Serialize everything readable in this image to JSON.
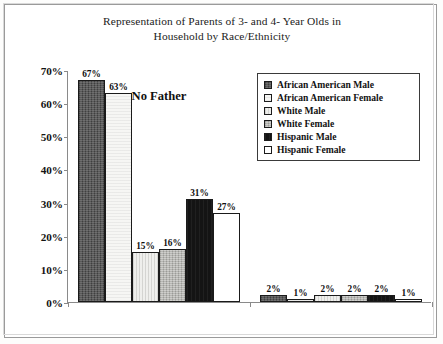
{
  "chart_data": {
    "type": "bar",
    "title": "Representation of Parents of 3- and 4- Year Olds in Household by Race/Ethnicity",
    "title_lines": [
      "Representation of Parents of 3- and 4- Year Olds in",
      "Household by Race/Ethnicity"
    ],
    "categories": [
      "No Father",
      "No Mother"
    ],
    "series": [
      {
        "name": "African American Male",
        "values": [
          67,
          2
        ],
        "labels": [
          "67%",
          "2%"
        ],
        "fill": "dark-gray-textured",
        "color": "#4d4d4d"
      },
      {
        "name": "African American Female",
        "values": [
          63,
          1
        ],
        "labels": [
          "63%",
          "1%"
        ],
        "fill": "white",
        "color": "#f6f6f4"
      },
      {
        "name": "White Male",
        "values": [
          15,
          2
        ],
        "labels": [
          "15%",
          "2%"
        ],
        "fill": "light-gray",
        "color": "#e9e9e6"
      },
      {
        "name": "White Female",
        "values": [
          16,
          2
        ],
        "labels": [
          "16%",
          "2%"
        ],
        "fill": "medium-gray-textured",
        "color": "#b9b9b5"
      },
      {
        "name": "Hispanic Male",
        "values": [
          31,
          2
        ],
        "labels": [
          "31%",
          "2%"
        ],
        "fill": "solid-black",
        "color": "#141414"
      },
      {
        "name": "Hispanic Female",
        "values": [
          27,
          1
        ],
        "labels": [
          "27%",
          "1%"
        ],
        "fill": "white",
        "color": "#ffffff"
      }
    ],
    "xlabel": "",
    "ylabel": "",
    "ylim": [
      0,
      70
    ],
    "ytick_values": [
      0,
      10,
      20,
      30,
      40,
      50,
      60,
      70
    ],
    "ytick_labels": [
      "0%",
      "10%",
      "20%",
      "30%",
      "40%",
      "50%",
      "60%",
      "70%"
    ],
    "grid": false,
    "legend_position": "top-right-inside",
    "value_labels_shown": true,
    "units": "percent"
  },
  "legend": {
    "entries": [
      {
        "label": "African American Male"
      },
      {
        "label": "African American Female"
      },
      {
        "label": "White Male"
      },
      {
        "label": "White Female"
      },
      {
        "label": "Hispanic Male"
      },
      {
        "label": "Hispanic Female"
      }
    ]
  }
}
